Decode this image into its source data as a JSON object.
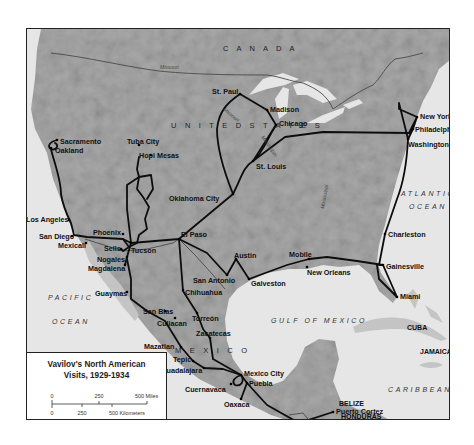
{
  "colors": {
    "land": "#a9a9a9",
    "land_light": "#c4c4c4",
    "land_dark": "#8a8a8a",
    "water": "#e6e6e6",
    "route": "#0d0d0d",
    "border": "#4a4a4a",
    "frame": "#222222"
  },
  "legend": {
    "title_line1": "Vavilov's North American",
    "title_line2": "Visits, 1929-1934",
    "scale": {
      "miles_labels": [
        "0",
        "250",
        "500 Miles"
      ],
      "km_labels": [
        "0",
        "250",
        "500 Kilometers"
      ]
    }
  },
  "countries": [
    {
      "label": "C A N A D A",
      "x": 196,
      "y": 22
    },
    {
      "label": "U N I T E D   S T A T E S",
      "x": 144,
      "y": 99
    },
    {
      "label": "M E X I C O",
      "x": 148,
      "y": 324
    },
    {
      "label": "GUATEMALA",
      "x": 244,
      "y": 395,
      "small": true
    },
    {
      "label": "BELIZE",
      "x": 312,
      "y": 377,
      "small": true
    },
    {
      "label": "HONDURAS",
      "x": 314,
      "y": 390,
      "small": true
    },
    {
      "label": "EL SALVADOR",
      "x": 274,
      "y": 413,
      "small": true
    },
    {
      "label": "NICARAGUA",
      "x": 336,
      "y": 405,
      "small": true
    },
    {
      "label": "CUBA",
      "x": 380,
      "y": 301,
      "small": true
    },
    {
      "label": "JAMAICA",
      "x": 393,
      "y": 325,
      "small": true
    }
  ],
  "oceans": [
    {
      "label": "ATLANTIC",
      "x": 374,
      "y": 167
    },
    {
      "label": "OCEAN",
      "x": 382,
      "y": 180
    },
    {
      "label": "GULF OF MEXICO",
      "x": 244,
      "y": 294
    },
    {
      "label": "PACIFIC",
      "x": 21,
      "y": 271
    },
    {
      "label": "OCEAN",
      "x": 25,
      "y": 295
    },
    {
      "label": "CARIBBEAN SEA",
      "x": 361,
      "y": 363
    }
  ],
  "rivers": [
    {
      "label": "Missouri",
      "x": 133,
      "y": 40,
      "rot": 0
    },
    {
      "label": "Missouri",
      "x": 196,
      "y": 81,
      "rot": 40
    },
    {
      "label": "Mississippi",
      "x": 234,
      "y": 108,
      "rot": 55
    },
    {
      "label": "Mississippi",
      "x": 297,
      "y": 180,
      "rot": -80
    }
  ],
  "cities": [
    {
      "name": "Sacramento",
      "x": 30,
      "y": 111,
      "dx": 3,
      "dy": 2
    },
    {
      "name": "Oakland",
      "x": 24,
      "y": 119,
      "dx": 4,
      "dy": 3
    },
    {
      "name": "Los Angeles",
      "x": 42,
      "y": 191,
      "dx": -43,
      "dy": 0
    },
    {
      "name": "San Diego",
      "x": 45,
      "y": 207,
      "dx": -33,
      "dy": 1
    },
    {
      "name": "Mexicali",
      "x": 59,
      "y": 214,
      "dx": -28,
      "dy": 3
    },
    {
      "name": "Tuba City",
      "x": 112,
      "y": 116,
      "dx": -12,
      "dy": -3
    },
    {
      "name": "Hopi Mesas",
      "x": 124,
      "y": 126,
      "dx": -12,
      "dy": 1
    },
    {
      "name": "Phoenix",
      "x": 96,
      "y": 205,
      "dx": -30,
      "dy": -1
    },
    {
      "name": "Sells",
      "x": 94,
      "y": 220,
      "dx": -17,
      "dy": 0
    },
    {
      "name": "Tucson",
      "x": 104,
      "y": 214,
      "dx": 0,
      "dy": 8
    },
    {
      "name": "Nogales",
      "x": 100,
      "y": 228,
      "dx": -30,
      "dy": 3
    },
    {
      "name": "Magdalena",
      "x": 98,
      "y": 236,
      "dx": -37,
      "dy": 4
    },
    {
      "name": "Guaymas",
      "x": 100,
      "y": 263,
      "dx": -32,
      "dy": 2
    },
    {
      "name": "El Paso",
      "x": 152,
      "y": 210,
      "dx": 2,
      "dy": -4
    },
    {
      "name": "Chihuahua",
      "x": 156,
      "y": 261,
      "dx": 2,
      "dy": 3
    },
    {
      "name": "San Blas",
      "x": 138,
      "y": 282,
      "dx": -22,
      "dy": 1
    },
    {
      "name": "Culiacan",
      "x": 148,
      "y": 289,
      "dx": -18,
      "dy": 6
    },
    {
      "name": "Torreón",
      "x": 170,
      "y": 284,
      "dx": -5,
      "dy": 6
    },
    {
      "name": "Zacatecas",
      "x": 183,
      "y": 309,
      "dx": -14,
      "dy": -4
    },
    {
      "name": "Mazatlan",
      "x": 154,
      "y": 318,
      "dx": -37,
      "dy": 0
    },
    {
      "name": "Tepic",
      "x": 166,
      "y": 332,
      "dx": -20,
      "dy": -1
    },
    {
      "name": "Guadalajara",
      "x": 177,
      "y": 339,
      "dx": -43,
      "dy": 3
    },
    {
      "name": "Mexico City",
      "x": 214,
      "y": 346,
      "dx": 3,
      "dy": -1
    },
    {
      "name": "Puebla",
      "x": 220,
      "y": 354,
      "dx": 2,
      "dy": 1
    },
    {
      "name": "Cuernavaca",
      "x": 204,
      "y": 355,
      "dx": -46,
      "dy": 6
    },
    {
      "name": "Oaxaca",
      "x": 214,
      "y": 370,
      "dx": -17,
      "dy": 6
    },
    {
      "name": "Guatemala City",
      "x": 272,
      "y": 394,
      "dx": -50,
      "dy": 7
    },
    {
      "name": "Puerto Cortez",
      "x": 306,
      "y": 383,
      "dx": 3,
      "dy": 0
    },
    {
      "name": "Oklahoma City",
      "x": 206,
      "y": 165,
      "dx": -64,
      "dy": 5
    },
    {
      "name": "Austin",
      "x": 209,
      "y": 230,
      "dx": -2,
      "dy": -3
    },
    {
      "name": "San Antonio",
      "x": 200,
      "y": 246,
      "dx": -34,
      "dy": 6
    },
    {
      "name": "Galveston",
      "x": 222,
      "y": 250,
      "dx": 2,
      "dy": 5
    },
    {
      "name": "Mobile",
      "x": 282,
      "y": 230,
      "dx": -20,
      "dy": -4
    },
    {
      "name": "New Orleans",
      "x": 280,
      "y": 238,
      "dx": 0,
      "dy": 6
    },
    {
      "name": "St. Paul",
      "x": 213,
      "y": 65,
      "dx": -28,
      "dy": -2
    },
    {
      "name": "Madison",
      "x": 240,
      "y": 81,
      "dx": 3,
      "dy": 0
    },
    {
      "name": "Chicago",
      "x": 249,
      "y": 96,
      "dx": 3,
      "dy": -1
    },
    {
      "name": "St. Louis",
      "x": 226,
      "y": 132,
      "dx": 3,
      "dy": 6
    },
    {
      "name": "New York",
      "x": 390,
      "y": 88,
      "dx": 3,
      "dy": 0
    },
    {
      "name": "Philadelphia",
      "x": 386,
      "y": 100,
      "dx": 2,
      "dy": 1
    },
    {
      "name": "Washington",
      "x": 381,
      "y": 110,
      "dx": 0,
      "dy": 6
    },
    {
      "name": "Charleston",
      "x": 358,
      "y": 205,
      "dx": 3,
      "dy": 1
    },
    {
      "name": "Gainesville",
      "x": 356,
      "y": 236,
      "dx": 3,
      "dy": 2
    },
    {
      "name": "Miami",
      "x": 370,
      "y": 268,
      "dx": 3,
      "dy": 0
    }
  ],
  "routes": [
    "M 30 111 C 22 113, 20 118, 24 120 C 30 122, 32 116, 28 114 M 24 120 C 26 130, 34 150, 34 165 C 36 178, 40 186, 44 194 L 47 206 L 60 208 L 96 210 L 104 214 L 100 228 L 98 236",
    "M 96 210 L 102 218 L 110 214 L 112 206 L 120 200 L 118 190 L 122 178 L 116 168 L 110 160 L 112 148 L 110 140 L 112 128 M 102 218 L 96 222 L 94 220 M 104 214 L 100 180 L 100 156 L 112 148 L 124 146 L 126 160 L 120 170",
    "M 100 230 L 104 250 L 104 270 L 120 282 L 138 292 L 154 318 L 166 332 L 177 339 L 196 340 L 214 346",
    "M 104 214 L 152 210 L 176 190 L 206 165 C 214 150, 216 138, 226 132 C 236 124, 240 110, 249 96",
    "M 152 210 L 156 262 L 170 284 L 176 300 L 183 309 L 186 330 L 214 346 L 220 354 L 240 376 L 272 394 L 306 383",
    "M 152 210 L 180 224 L 200 246 L 209 230 L 222 250 L 260 236 L 282 230 L 300 228 L 330 232 L 356 236",
    "M 206 165 C 196 140, 190 120, 190 100 C 192 82, 200 74, 213 65 L 240 81 L 249 96 L 226 132 L 258 108 L 296 103 L 382 104 L 390 88 L 372 80 L 372 74 L 381 110 L 386 100 L 390 88",
    "M 381 110 C 380 130, 378 150, 370 170 L 358 205 L 352 236 L 356 236 L 370 268 L 352 250 L 350 236",
    "M 214 346 C 208 348, 204 352, 208 356 C 214 358, 218 352, 214 346 M 220 354 L 214 370"
  ],
  "borders": [
    "M 24 24 C 60 28, 100 38, 132 42 C 160 45, 196 46, 240 46 C 255 48, 262 52, 276 54 C 290 60, 300 66, 306 80 C 318 72, 332 62, 346 56 C 356 46, 358 38, 368 30 L 380 28 L 396 24",
    "M 58 210 L 96 222 L 120 220 L 146 214 L 152 210 L 168 226 L 186 246 L 198 260",
    "M 262 386 L 276 384 L 286 396 L 300 404 M 300 404 L 312 396 L 330 392 L 346 390"
  ]
}
